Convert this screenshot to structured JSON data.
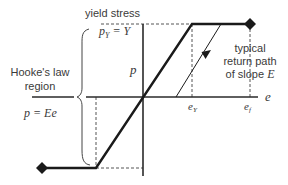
{
  "diagram": {
    "type": "stress-strain (elastic-perfectly plastic)",
    "labels": {
      "yield_stress_title": "yield stress",
      "yield_eq_p": "p",
      "yield_eq_sub": "Y",
      "yield_eq_rhs": " = Y",
      "hookes_law_line1": "Hooke's law",
      "hookes_law_line2": "region",
      "hookes_eq": "p = Ee",
      "vertical_axis": "p",
      "horizontal_axis": "e",
      "tick_ey_main": "e",
      "tick_ey_sub": "Y",
      "tick_ef_main": "e",
      "tick_ef_sub": "f",
      "return_line1": "typical",
      "return_line2": "return path",
      "return_line3_pre": "of slope ",
      "return_line3_var": "E"
    },
    "colors": {
      "curve": "#1a1a1a",
      "axis": "#2a2a2a",
      "dashed": "#555555",
      "text": "#3a3a3a"
    }
  }
}
